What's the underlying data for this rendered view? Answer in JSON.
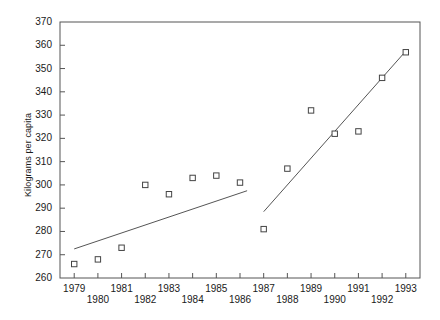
{
  "chart_data": {
    "type": "scatter",
    "title": "",
    "subtitle": "",
    "xlabel": "",
    "ylabel": "Kilograms per capita",
    "x": [
      1979,
      1980,
      1981,
      1982,
      1983,
      1984,
      1985,
      1986,
      1987,
      1988,
      1989,
      1990,
      1991,
      1992,
      1993
    ],
    "values": [
      266,
      268,
      273,
      300,
      296,
      303,
      304,
      301,
      281,
      307,
      332,
      322,
      323,
      346,
      357
    ],
    "categories": [
      "1979",
      "1980",
      "1981",
      "1982",
      "1983",
      "1984",
      "1985",
      "1986",
      "1987",
      "1988",
      "1989",
      "1990",
      "1991",
      "1992",
      "1993"
    ],
    "xlim": [
      1978.4,
      1993.6
    ],
    "ylim": [
      260,
      370
    ],
    "ytick_labels": [
      "260",
      "270",
      "280",
      "290",
      "300",
      "310",
      "320",
      "330",
      "340",
      "350",
      "360",
      "370"
    ],
    "ytick_values": [
      260,
      270,
      280,
      290,
      300,
      310,
      320,
      330,
      340,
      350,
      360,
      370
    ],
    "xtick_labels": [
      "1979",
      "1980",
      "1981",
      "1982",
      "1983",
      "1984",
      "1985",
      "1986",
      "1987",
      "1988",
      "1989",
      "1990",
      "1991",
      "1992",
      "1993"
    ],
    "grid": false,
    "legend": "none",
    "marker": "open-square",
    "marker_color": "#444444",
    "line_color": "#555555",
    "axis_color": "#555555",
    "trend_lines": [
      {
        "name": "segment-1979-1986",
        "x_start": 1979.0,
        "y_start": 272.5,
        "x_end": 1986.3,
        "y_end": 297.5
      },
      {
        "name": "segment-1987-1993",
        "x_start": 1987.0,
        "y_start": 288.5,
        "x_end": 1993.0,
        "y_end": 357.5
      }
    ],
    "axis_spines": [
      "left",
      "bottom",
      "top",
      "right"
    ],
    "ytick_side": "left-inward",
    "xtick_side": "bottom-staggered"
  },
  "figure": {
    "caption_fragment": ""
  }
}
